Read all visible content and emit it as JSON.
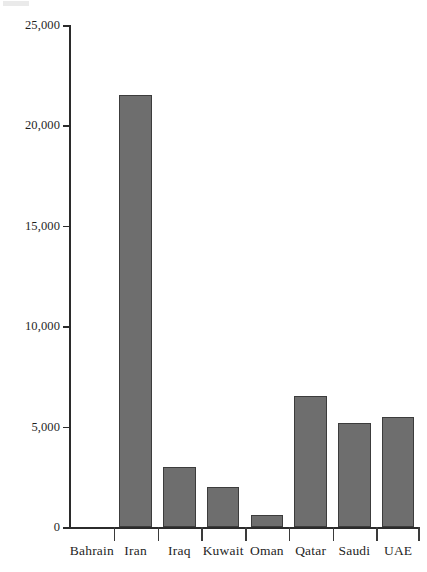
{
  "chart_data": {
    "type": "bar",
    "title": "",
    "subtitle": "",
    "xlabel": "",
    "ylabel": "",
    "categories": [
      "Bahrain",
      "Iran",
      "Iraq",
      "Kuwait",
      "Oman",
      "Qatar",
      "Saudi",
      "UAE"
    ],
    "values": [
      0,
      21500,
      3000,
      2000,
      600,
      6500,
      5200,
      5500
    ],
    "series": [
      {
        "name": "",
        "values": [
          0,
          21500,
          3000,
          2000,
          600,
          6500,
          5200,
          5500
        ]
      }
    ],
    "ylim": [
      0,
      25000
    ],
    "ytick_labels": [
      "0",
      "5,000",
      "10,000",
      "15,000",
      "20,000",
      "25,000"
    ],
    "ytick_values": [
      0,
      5000,
      10000,
      15000,
      20000,
      25000
    ],
    "grid": false,
    "legend": null,
    "annotations": [],
    "colors": {
      "bar_fill": "#6e6e6e",
      "bar_edge": "#3c3c3c",
      "axis": "#2b2b2b",
      "text": "#1f1f1f",
      "background": "#ffffff"
    }
  }
}
